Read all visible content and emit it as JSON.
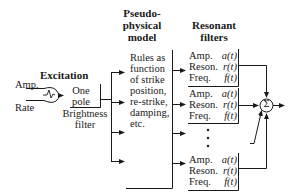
{
  "excitation": {
    "title": "Excitation",
    "amp_label": "Amp.",
    "rate_label": "Rate",
    "pulse_icon": "pulse-icon"
  },
  "brightness_filter": {
    "line1": "One",
    "line2": "pole",
    "caption1": "Brightness",
    "caption2": "filter"
  },
  "pseudo_physical_model": {
    "title_line1": "Pseudo-",
    "title_line2": "physical",
    "title_line3": "model",
    "body": [
      "Rules as",
      "function",
      "of strike",
      "position,",
      "re-strike,",
      "damping,",
      "etc."
    ]
  },
  "resonant_filters": {
    "title_line1": "Resonant",
    "title_line2": "filters",
    "filters": [
      {
        "amp": "Amp.",
        "amp_fn": "a(t)",
        "reson": "Reson.",
        "reson_fn": "r(t)",
        "freq": "Freq.",
        "freq_fn": "f(t)"
      },
      {
        "amp": "Amp.",
        "amp_fn": "a(t)",
        "reson": "Reson.",
        "reson_fn": "r(t)",
        "freq": "Freq.",
        "freq_fn": "f(t)"
      },
      {
        "amp": "Amp.",
        "amp_fn": "a(t)",
        "reson": "Reson.",
        "reson_fn": "r(t)",
        "freq": "Freq.",
        "freq_fn": "f(t)"
      }
    ],
    "ellipsis": "⋮"
  },
  "summer": {
    "symbol": "Σ"
  }
}
